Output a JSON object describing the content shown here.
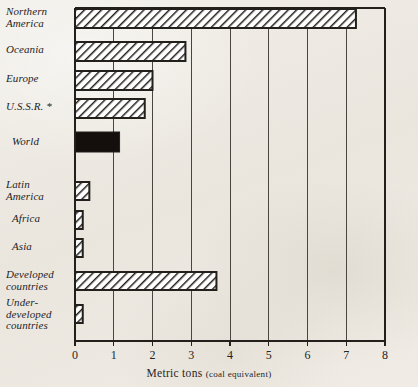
{
  "chart_data": {
    "type": "bar",
    "orientation": "horizontal",
    "title": "",
    "xlabel": "Metric tons (coal equivalent)",
    "xlabel_main": "Metric tons",
    "xlabel_note": "(coal equivalent)",
    "ylabel": "",
    "xlim": [
      0,
      8
    ],
    "xticks": [
      0,
      1,
      2,
      3,
      4,
      5,
      6,
      7,
      8
    ],
    "xtick_labels": [
      "0",
      "1",
      "2",
      "3",
      "4",
      "5",
      "6",
      "7",
      "8"
    ],
    "grid": "vertical",
    "legend": "none",
    "footnote_marker": "*",
    "categories": [
      "Northern America",
      "Oceania",
      "Europe",
      "U.S.S.R. *",
      "World",
      "Latin America",
      "Africa",
      "Asia",
      "Developed countries",
      "Under-developed countries"
    ],
    "values": [
      7.25,
      2.85,
      2.0,
      1.8,
      1.15,
      0.37,
      0.2,
      0.2,
      3.65,
      0.2
    ],
    "bar_styles": [
      "hatched",
      "hatched",
      "hatched",
      "hatched",
      "solid-black",
      "hatched",
      "hatched",
      "hatched",
      "hatched",
      "hatched"
    ]
  },
  "rows": [
    {
      "label": "Northern\nAmerica",
      "value": 7.25,
      "style": "hatched",
      "y": 9,
      "h": 19
    },
    {
      "label": "Oceania",
      "value": 2.85,
      "style": "hatched",
      "y": 42,
      "h": 19
    },
    {
      "label": "Europe",
      "value": 2.0,
      "style": "hatched",
      "y": 71,
      "h": 19
    },
    {
      "label": "U.S.S.R. *",
      "value": 1.8,
      "style": "hatched",
      "y": 99,
      "h": 19
    },
    {
      "label": "World",
      "value": 1.15,
      "style": "solid-black",
      "y": 132,
      "h": 20
    },
    {
      "label": "Latin\nAmerica",
      "value": 0.37,
      "style": "hatched",
      "y": 182,
      "h": 18
    },
    {
      "label": "Africa",
      "value": 0.2,
      "style": "hatched",
      "y": 211,
      "h": 18
    },
    {
      "label": "Asia",
      "value": 0.2,
      "style": "hatched",
      "y": 239,
      "h": 18
    },
    {
      "label": "Developed\ncountries",
      "value": 3.65,
      "style": "hatched",
      "y": 272,
      "h": 18
    },
    {
      "label": "Under-\ndeveloped\ncountries",
      "value": 0.2,
      "style": "hatched",
      "y": 305,
      "h": 18
    }
  ],
  "label_positions": [
    {
      "x": 6,
      "y": 6
    },
    {
      "x": 6,
      "y": 44
    },
    {
      "x": 6,
      "y": 73
    },
    {
      "x": 6,
      "y": 101
    },
    {
      "x": 12,
      "y": 136
    },
    {
      "x": 6,
      "y": 179
    },
    {
      "x": 12,
      "y": 213
    },
    {
      "x": 12,
      "y": 241
    },
    {
      "x": 6,
      "y": 269
    },
    {
      "x": 6,
      "y": 297
    }
  ],
  "colors": {
    "ink": "#231f1b",
    "paper": "#efece6",
    "grid": "#4a453e",
    "bar_fill": "#ffffff",
    "bar_hatch": "#231f1b",
    "bar_solid": "#140f0c"
  },
  "geometry": {
    "plot_left": 75,
    "plot_right": 385,
    "plot_top": 8,
    "plot_bottom": 341,
    "px_per_unit": 38.75
  }
}
